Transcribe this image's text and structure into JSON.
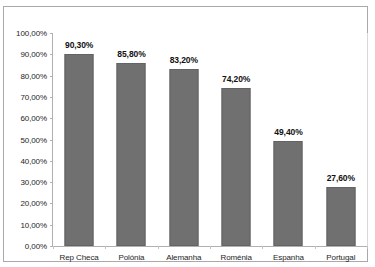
{
  "chart_title": "o ensino secundário",
  "chart_data": {
    "type": "bar",
    "title": "o ensino secundário",
    "xlabel": "",
    "ylabel": "",
    "ylim": [
      0,
      100
    ],
    "grid": false,
    "legend": "none",
    "value_suffix": "%",
    "decimal_separator": ",",
    "bar_color": "#707070",
    "categories": [
      "Rep Checa",
      "Polónia",
      "Alemanha",
      "Roménia",
      "Espanha",
      "Portugal"
    ],
    "values": [
      90.3,
      85.8,
      83.2,
      74.2,
      49.4,
      27.6
    ],
    "value_labels": [
      "90,30%",
      "85,80%",
      "83,20%",
      "74,20%",
      "49,40%",
      "27,60%"
    ],
    "ytick_values": [
      100,
      90,
      80,
      70,
      60,
      50,
      40,
      30,
      20,
      10,
      0
    ],
    "ytick_labels": [
      "100,00%",
      "90,00%",
      "80,00%",
      "70,00%",
      "60,00%",
      "50,00%",
      "40,00%",
      "30,00%",
      "20,00%",
      "10,00%",
      "0,00%"
    ]
  }
}
